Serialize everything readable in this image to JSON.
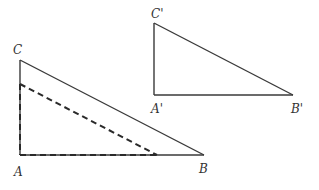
{
  "diagram": {
    "type": "geometry",
    "colors": {
      "line": "#3a3a3a",
      "label": "#333333",
      "background": "#ffffff"
    },
    "triangles": [
      {
        "id": "ABC",
        "style": "solid",
        "vertices": {
          "A": {
            "label": "A",
            "x": 20,
            "y": 155
          },
          "B": {
            "label": "B",
            "x": 204,
            "y": 155
          },
          "C": {
            "label": "C",
            "x": 20,
            "y": 60
          }
        },
        "right_angle_at": "A"
      },
      {
        "id": "ABC-dashed-inner",
        "style": "dashed",
        "vertices": {
          "A": {
            "x": 20,
            "y": 155
          },
          "P": {
            "x": 157,
            "y": 155
          },
          "Q": {
            "x": 20,
            "y": 84
          }
        }
      },
      {
        "id": "A'B'C'",
        "style": "solid",
        "vertices": {
          "A'": {
            "label": "A'",
            "x": 154,
            "y": 95
          },
          "B'": {
            "label": "B'",
            "x": 293,
            "y": 95
          },
          "C'": {
            "label": "C'",
            "x": 154,
            "y": 23
          }
        },
        "right_angle_at": "A'"
      }
    ],
    "labels": {
      "A": "A",
      "B": "B",
      "C": "C",
      "A_prime": "A'",
      "B_prime": "B'",
      "C_prime": "C'"
    }
  }
}
